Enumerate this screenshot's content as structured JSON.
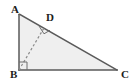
{
  "figure": {
    "canvas": {
      "width": 133,
      "height": 82
    },
    "colors": {
      "background": "#ffffff",
      "triangle_fill": "#efefef",
      "stroke": "#5a5a5a",
      "dashed_stroke": "#8a8a8a",
      "label_text": "#1c1c1c"
    },
    "points": {
      "A": {
        "x": 19,
        "y": 14
      },
      "B": {
        "x": 19,
        "y": 70
      },
      "C": {
        "x": 117,
        "y": 70
      },
      "D": {
        "x": 44,
        "y": 28
      }
    },
    "labels": [
      {
        "id": "A",
        "text": "A",
        "x": 11,
        "y": 13
      },
      {
        "id": "D",
        "text": "D",
        "x": 46,
        "y": 21
      },
      {
        "id": "B",
        "text": "B",
        "x": 10,
        "y": 78
      },
      {
        "id": "C",
        "text": "C",
        "x": 121,
        "y": 78
      }
    ],
    "segments": [
      {
        "id": "AB",
        "from": "A",
        "to": "B",
        "style": "solid"
      },
      {
        "id": "BC",
        "from": "B",
        "to": "C",
        "style": "solid"
      },
      {
        "id": "AC",
        "from": "A",
        "to": "C",
        "style": "solid"
      },
      {
        "id": "BD",
        "from": "B",
        "to": "D",
        "style": "dashed"
      }
    ],
    "right_angles": [
      {
        "id": "angle-B",
        "at": "B",
        "measure": "90"
      },
      {
        "id": "angle-D",
        "at": "D",
        "measure": "90"
      }
    ],
    "geometry_paths": {
      "triangle_fill_path": "M 19 14 L 117 70 L 19 70 Z",
      "side_ab_path": "M 19 14 L 19 70",
      "side_bc_path": "M 19 70 L 117 70",
      "side_ac_path": "M 19 14 L 117 70",
      "altitude_bd_path": "M 19 70 L 44 28",
      "right_angle_b_path": "M 19 62 L 27 62 L 27 70",
      "right_angle_d_path": "M 38.4 25.0 L 44.0 33.8 L 50.0 30.3"
    },
    "dash_pattern": "2.4 2.2"
  }
}
